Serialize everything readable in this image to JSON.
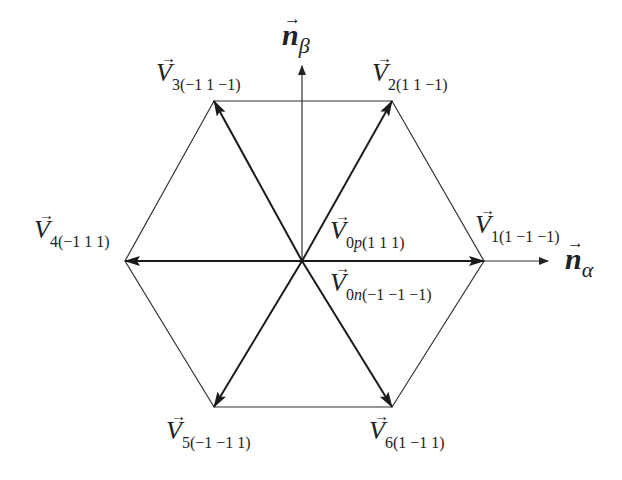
{
  "diagram": {
    "colors": {
      "line": "#333333",
      "background": "#ffffff"
    },
    "center": {
      "x": 302,
      "y": 261
    },
    "axes": {
      "alpha": {
        "symbol": "n",
        "subscript": "α",
        "arrow": "→",
        "end": {
          "x": 548,
          "y": 261
        }
      },
      "beta": {
        "symbol": "n",
        "subscript": "β",
        "arrow": "→",
        "end": {
          "x": 302,
          "y": 66
        }
      }
    },
    "vectors": [
      {
        "id": "V1",
        "symbol": "V",
        "arrow": "→",
        "index": "1",
        "state": "(1   −1   −1)",
        "tip": {
          "x": 484,
          "y": 261
        }
      },
      {
        "id": "V2",
        "symbol": "V",
        "arrow": "→",
        "index": "2",
        "state": "(1   1   −1)",
        "tip": {
          "x": 392,
          "y": 101
        }
      },
      {
        "id": "V3",
        "symbol": "V",
        "arrow": "→",
        "index": "3",
        "state": "(−1   1   −1)",
        "tip": {
          "x": 214,
          "y": 101
        }
      },
      {
        "id": "V4",
        "symbol": "V",
        "arrow": "→",
        "index": "4",
        "state": "(−1   1   1)",
        "tip": {
          "x": 125,
          "y": 261
        }
      },
      {
        "id": "V5",
        "symbol": "V",
        "arrow": "→",
        "index": "5",
        "state": "(−1   −1   1)",
        "tip": {
          "x": 214,
          "y": 407
        }
      },
      {
        "id": "V6",
        "symbol": "V",
        "arrow": "→",
        "index": "6",
        "state": "(1   −1   1)",
        "tip": {
          "x": 392,
          "y": 407
        }
      }
    ],
    "zero_vectors": [
      {
        "id": "V0p",
        "symbol": "V",
        "arrow": "→",
        "index": "0",
        "index_suffix": "p",
        "state": "(1   1   1)"
      },
      {
        "id": "V0n",
        "symbol": "V",
        "arrow": "→",
        "index": "0",
        "index_suffix": "n",
        "state": "(−1   −1   −1)"
      }
    ]
  }
}
